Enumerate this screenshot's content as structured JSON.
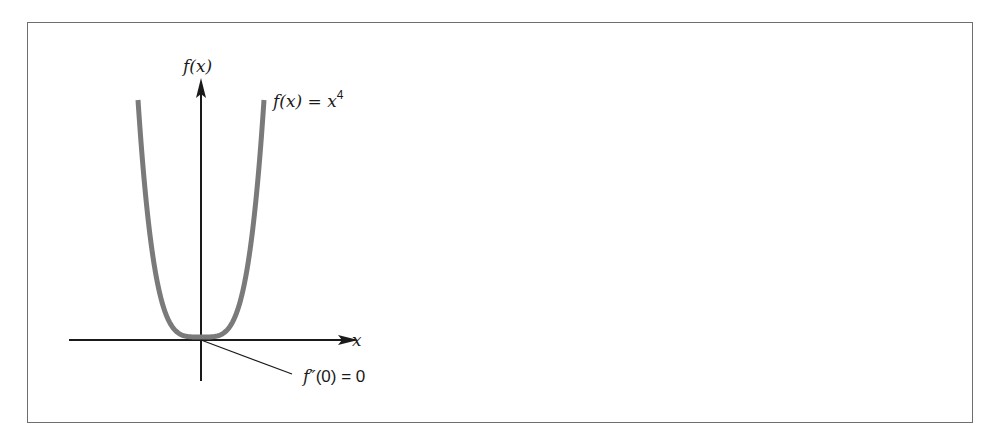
{
  "figure": {
    "y_axis_label": "f(x)",
    "x_axis_label": "x",
    "curve_label_lhs": "f(x) = x",
    "curve_label_exponent": "4",
    "annotation_lhs": "f″",
    "annotation_rhs": "(0) = 0"
  },
  "chart_data": {
    "type": "line",
    "title": "",
    "xlabel": "x",
    "ylabel": "f(x)",
    "function": "x^4",
    "series": [
      {
        "name": "f(x) = x^4",
        "color": "#7a7a7a"
      }
    ],
    "annotations": [
      {
        "text": "f''(0) = 0",
        "points_to": [
          0,
          0
        ]
      }
    ],
    "grid": false,
    "ticks": "none"
  },
  "colors": {
    "curve": "#7a7a7a",
    "axes": "#1a1a1a",
    "frame": "#6e6e6e"
  }
}
